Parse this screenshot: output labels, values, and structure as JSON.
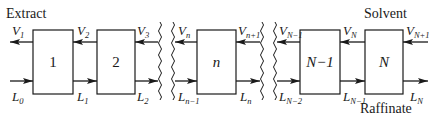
{
  "diagram": {
    "title_left": "Extract",
    "title_right_top": "Solvent",
    "title_right_bottom": "Raffinate",
    "stages": [
      {
        "label": "1",
        "italic": false
      },
      {
        "label": "2",
        "italic": false
      },
      {
        "label": "n",
        "italic": true
      },
      {
        "label": "N−1",
        "italic": true
      },
      {
        "label": "N",
        "italic": true
      }
    ],
    "vapor_labels": [
      {
        "base": "V",
        "sub": "1"
      },
      {
        "base": "V",
        "sub": "2"
      },
      {
        "base": "V",
        "sub": "3"
      },
      {
        "base": "V",
        "sub": "n"
      },
      {
        "base": "V",
        "sub": "n+1"
      },
      {
        "base": "V",
        "sub": "N−1"
      },
      {
        "base": "V",
        "sub": "N"
      },
      {
        "base": "V",
        "sub": "N+1"
      }
    ],
    "liquid_labels": [
      {
        "base": "L",
        "sub": "0"
      },
      {
        "base": "L",
        "sub": "1"
      },
      {
        "base": "L",
        "sub": "2"
      },
      {
        "base": "L",
        "sub": "n−1"
      },
      {
        "base": "L",
        "sub": "n"
      },
      {
        "base": "L",
        "sub": "N−2"
      },
      {
        "base": "L",
        "sub": "N−1"
      },
      {
        "base": "L",
        "sub": "N"
      }
    ],
    "flow": {
      "top_stream": "right-to-left",
      "bottom_stream": "left-to-right"
    },
    "breaks": 2
  }
}
